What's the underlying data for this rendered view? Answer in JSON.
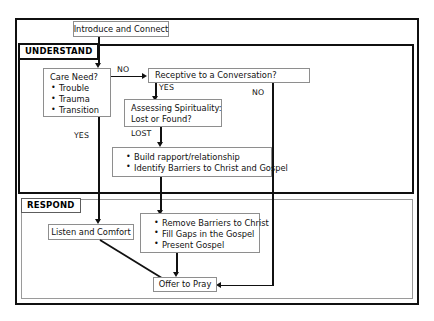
{
  "diagram": {
    "sections": [
      {
        "id": "understand",
        "label": "UNDERSTAND"
      },
      {
        "id": "respond",
        "label": "RESPOND"
      }
    ],
    "nodes": {
      "introduce": {
        "label": "Introduce and Connect"
      },
      "care_need": {
        "header": "Care Need?",
        "items": [
          "Trouble",
          "Trauma",
          "Transition"
        ]
      },
      "receptive": {
        "label": "Receptive to a Conversation?"
      },
      "assessing": {
        "line1": "Assessing Spirituality:",
        "line2": "Lost or Found?"
      },
      "build": {
        "items": [
          "Build rapport/relationship",
          "Identify Barriers to Christ and Gospel"
        ]
      },
      "listen": {
        "label": "Listen and Comfort"
      },
      "remove": {
        "items": [
          "Remove Barriers to Christ",
          "Fill Gaps in the Gospel",
          "Present Gospel"
        ]
      },
      "pray": {
        "label": "Offer to Pray"
      }
    },
    "edge_labels": {
      "care_to_receptive": "NO",
      "receptive_yes": "YES",
      "receptive_no": "NO",
      "care_yes": "YES",
      "assessing_lost": "LOST"
    },
    "colors": {
      "frame": "#101010",
      "node_border": "#8e8e8e",
      "respond_frame": "#9a9a9a",
      "line": "#111111",
      "background": "#ffffff"
    }
  }
}
